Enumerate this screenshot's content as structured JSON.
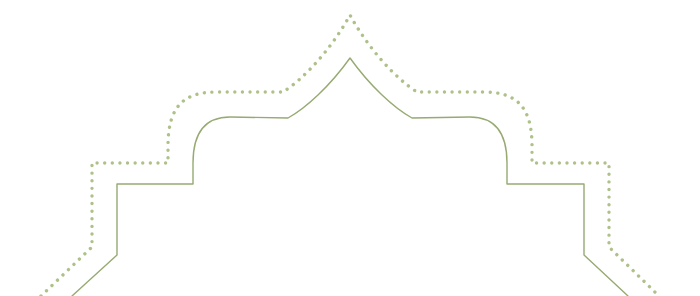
{
  "document": {
    "title": "Decorative Arch Ornament",
    "kind": "vector-line-ornament",
    "canvas": {
      "width": 700,
      "height": 296,
      "background_color": "#ffffff"
    }
  },
  "ornament": {
    "name": "mughal-mosque-arch-border",
    "description": "Symmetric Islamic mosque silhouette border with an onion-dome ogee arch flanked by stepped towers, drawn as two parallel contours",
    "symmetry_axis_x": 350,
    "contours": [
      {
        "id": "inner-solid-contour",
        "style": "solid",
        "color": "#96aa72",
        "stroke_width": 1.4,
        "path": "M 72 296 L 117 255 L 117 184 L 193 184 L 193 163 C 193 131 206 117 230 117 L 288 118 C 306 108 330 86 350 58 C 370 86 394 108 412 118 L 470 117 C 494 117 507 131 507 163 L 507 184 L 584 184 L 584 255 L 628 296"
      },
      {
        "id": "outer-dotted-contour",
        "style": "dotted",
        "color": "#adc188",
        "stroke_width": 3.4,
        "dot_spacing": 11,
        "path": "M 41 296 L 92 247 L 92 163 L 168 163 L 168 146 C 168 104 186 92 217 92 L 283 92 C 305 78 332 48 350 15 C 368 48 395 78 417 92 L 483 92 C 514 92 532 104 532 146 L 532 163 L 609 163 L 609 247 L 659 296"
      }
    ],
    "key_points": {
      "apex_solid": [
        350,
        58
      ],
      "apex_dotted": [
        350,
        15
      ],
      "left_shoulder": [
        288,
        118
      ],
      "right_shoulder": [
        412,
        118
      ],
      "dome_plateau_y": 117,
      "tower_shelf_y": 184,
      "left_tower_x": 117,
      "right_tower_x": 584,
      "tower_kink_y": 255
    }
  },
  "palette": {
    "line_green": "#96aa72",
    "dot_green": "#adc188",
    "background": "#ffffff"
  }
}
